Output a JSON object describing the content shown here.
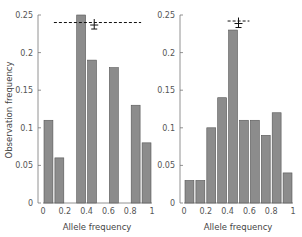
{
  "colors": {
    "bar_fill": "#8c8c8c",
    "bar_stroke": "#555555",
    "axis": "#777777",
    "text": "#555555",
    "dash": "#111111"
  },
  "shared": {
    "ylabel": "Observation frequency",
    "xlabel": "Allele frequency",
    "y_ticks": [
      "0",
      "0.05",
      "0.1",
      "0.15",
      "0.2",
      "0.25"
    ],
    "x_ticks": [
      "0",
      "0.2",
      "0.4",
      "0.6",
      "0.8",
      "1"
    ]
  },
  "chart_data": [
    {
      "type": "bar",
      "title": "",
      "xlabel": "Allele frequency",
      "ylabel": "Observation frequency",
      "bins": [
        [
          0,
          0.1
        ],
        [
          0.1,
          0.2
        ],
        [
          0.2,
          0.3
        ],
        [
          0.3,
          0.4
        ],
        [
          0.4,
          0.5
        ],
        [
          0.5,
          0.6
        ],
        [
          0.6,
          0.7
        ],
        [
          0.7,
          0.8
        ],
        [
          0.8,
          0.9
        ],
        [
          0.9,
          1.0
        ]
      ],
      "categories": [
        "0-0.1",
        "0.1-0.2",
        "0.2-0.3",
        "0.3-0.4",
        "0.4-0.5",
        "0.5-0.6",
        "0.6-0.7",
        "0.7-0.8",
        "0.8-0.9",
        "0.9-1.0"
      ],
      "values": [
        0.11,
        0.06,
        0,
        0.25,
        0.19,
        0,
        0.18,
        0,
        0.13,
        0.08
      ],
      "xlim": [
        0,
        1
      ],
      "ylim": [
        0,
        0.25
      ],
      "annotations": {
        "dashed_line_y": 0.24,
        "dashed_line_x": [
          0.1,
          0.9
        ],
        "error_marker_x": 0.47,
        "error_marker_y": 0.238
      },
      "grid": false
    },
    {
      "type": "bar",
      "title": "",
      "xlabel": "Allele frequency",
      "ylabel": "",
      "bins": [
        [
          0,
          0.1
        ],
        [
          0.1,
          0.2
        ],
        [
          0.2,
          0.3
        ],
        [
          0.3,
          0.4
        ],
        [
          0.4,
          0.5
        ],
        [
          0.5,
          0.6
        ],
        [
          0.6,
          0.7
        ],
        [
          0.7,
          0.8
        ],
        [
          0.8,
          0.9
        ],
        [
          0.9,
          1.0
        ]
      ],
      "categories": [
        "0-0.1",
        "0.1-0.2",
        "0.2-0.3",
        "0.3-0.4",
        "0.4-0.5",
        "0.5-0.6",
        "0.6-0.7",
        "0.7-0.8",
        "0.8-0.9",
        "0.9-1.0"
      ],
      "values": [
        0.03,
        0.03,
        0.1,
        0.14,
        0.23,
        0.11,
        0.11,
        0.09,
        0.12,
        0.04
      ],
      "xlim": [
        0,
        1
      ],
      "ylim": [
        0,
        0.25
      ],
      "annotations": {
        "dashed_line_y": 0.242,
        "dashed_line_x": [
          0.4,
          0.6
        ],
        "error_marker_x": 0.5,
        "error_marker_y": 0.24
      },
      "grid": false
    }
  ]
}
